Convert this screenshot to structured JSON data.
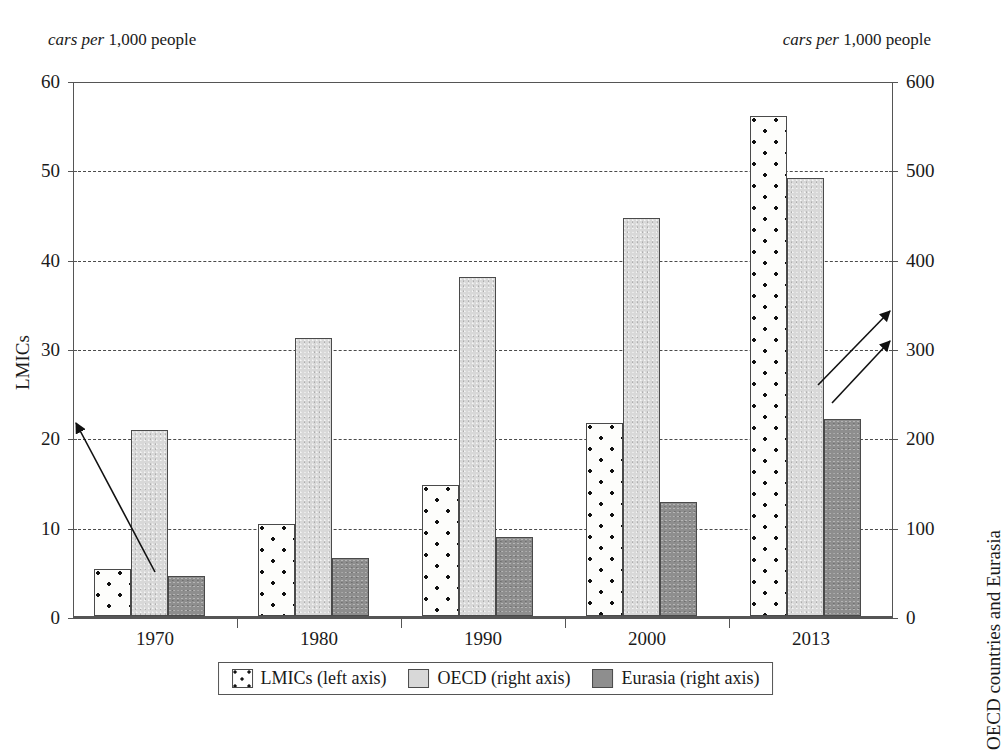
{
  "chart_data": {
    "type": "bar",
    "title": "",
    "categories": [
      "1970",
      "1980",
      "1990",
      "2000",
      "2013"
    ],
    "series": [
      {
        "name": "LMICs (left axis)",
        "axis": "left",
        "key": "lmics",
        "color": "#ffffff",
        "pattern": "white with black dots",
        "values": [
          5.3,
          10.3,
          14.7,
          21.6,
          56.0
        ]
      },
      {
        "name": "OECD (right axis)",
        "axis": "right",
        "key": "oecd",
        "color": "#d8d8d8",
        "pattern": "light gray",
        "values": [
          208,
          311,
          380,
          445,
          490
        ]
      },
      {
        "name": "Eurasia (right axis)",
        "axis": "right",
        "key": "eurasia",
        "color": "#8e8e8e",
        "pattern": "dark gray",
        "values": [
          45,
          65,
          88,
          128,
          220
        ]
      }
    ],
    "left_axis": {
      "title": "LMICs",
      "unit_caption_plain": "cars per 1,000 people",
      "unit_caption_italic": "cars per",
      "unit_caption_roman": "1,000 people",
      "ticks": [
        "0",
        "10",
        "20",
        "30",
        "40",
        "50",
        "60"
      ],
      "tick_values": [
        0,
        10,
        20,
        30,
        40,
        50,
        60
      ],
      "min": 0,
      "max": 60
    },
    "right_axis": {
      "title": "OECD countries and Eurasia",
      "unit_caption_plain": "cars per 1,000 people",
      "unit_caption_italic": "cars per",
      "unit_caption_roman": "1,000 people",
      "ticks": [
        "0",
        "100",
        "200",
        "300",
        "400",
        "500",
        "600"
      ],
      "tick_values": [
        0,
        100,
        200,
        300,
        400,
        500,
        600
      ],
      "min": 0,
      "max": 600
    },
    "xlabel": "",
    "grid": "horizontal dashed gridlines at each left-axis tick",
    "legend_position": "bottom-center",
    "legend": [
      "LMICs (left axis)",
      "OECD (right axis)",
      "Eurasia (right axis)"
    ],
    "annotations": [
      {
        "name": "arrow-lmics-to-left-axis",
        "description": "arrow from 1970 LMICs bar top pointing up-left to the left axis",
        "from_x": 155,
        "from_y": 572,
        "to_x": 76,
        "to_y": 423
      },
      {
        "name": "arrow-oecd-to-right-axis",
        "description": "arrow from 2013 OECD bar pointing up-right to the right axis",
        "from_x": 818,
        "top_label": "",
        "from_y": 385,
        "to_x": 890,
        "to_y": 311
      },
      {
        "name": "arrow-eurasia-to-right-axis",
        "description": "arrow from 2013 Eurasia bar top pointing up-right to the right axis",
        "from_x": 832,
        "from_y": 403,
        "to_x": 890,
        "to_y": 341
      }
    ]
  }
}
